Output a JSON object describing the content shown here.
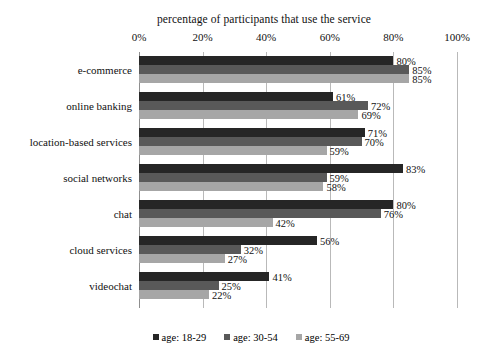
{
  "chart_data": {
    "type": "bar",
    "orientation": "horizontal",
    "title": "percentage of participants that use the service",
    "xlabel": "",
    "ylabel": "",
    "xlim": [
      0,
      100
    ],
    "xticks": [
      "0%",
      "20%",
      "40%",
      "60%",
      "80%",
      "100%"
    ],
    "xtick_values": [
      0,
      20,
      40,
      60,
      80,
      100
    ],
    "grid": true,
    "legend_position": "bottom",
    "categories": [
      "e-commerce",
      "online banking",
      "location-based services",
      "social networks",
      "chat",
      "cloud services",
      "videochat"
    ],
    "series": [
      {
        "name": "age: 18-29",
        "color": "#262626",
        "values": [
          80,
          61,
          71,
          83,
          80,
          56,
          41
        ],
        "labels": [
          "80%",
          "61%",
          "71%",
          "83%",
          "80%",
          "56%",
          "41%"
        ]
      },
      {
        "name": "age: 30-54",
        "color": "#595959",
        "values": [
          85,
          72,
          70,
          59,
          76,
          32,
          25
        ],
        "labels": [
          "85%",
          "72%",
          "70%",
          "59%",
          "76%",
          "32%",
          "25%"
        ]
      },
      {
        "name": "age: 55-69",
        "color": "#a6a6a6",
        "values": [
          85,
          69,
          59,
          58,
          42,
          27,
          22
        ],
        "labels": [
          "85%",
          "69%",
          "59%",
          "58%",
          "42%",
          "27%",
          "22%"
        ]
      }
    ]
  },
  "legend": {
    "items": [
      {
        "label": "age: 18-29",
        "color": "#262626"
      },
      {
        "label": "age: 30-54",
        "color": "#595959"
      },
      {
        "label": "age: 55-69",
        "color": "#a6a6a6"
      }
    ]
  }
}
